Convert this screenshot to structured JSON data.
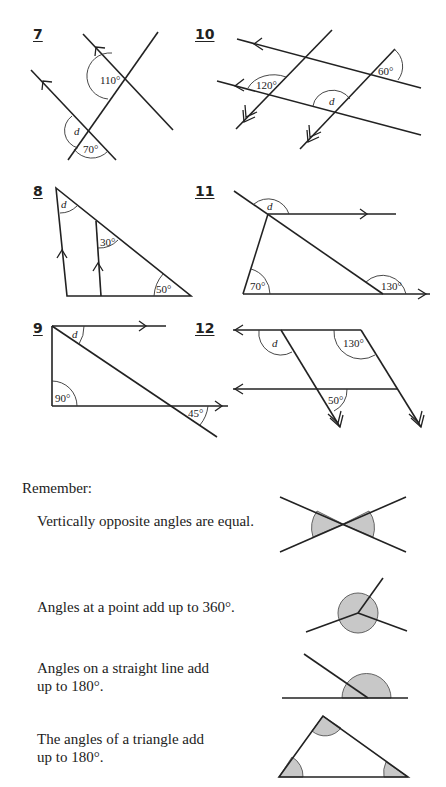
{
  "questions": [
    {
      "number": "7",
      "labels": {
        "a": "110°",
        "b": "70°",
        "unknown": "d"
      }
    },
    {
      "number": "10",
      "labels": {
        "a": "120°",
        "b": "60°",
        "unknown": "d"
      }
    },
    {
      "number": "8",
      "labels": {
        "a": "30°",
        "b": "50°",
        "unknown": "d"
      }
    },
    {
      "number": "11",
      "labels": {
        "a": "70°",
        "b": "130°",
        "unknown": "d"
      }
    },
    {
      "number": "9",
      "labels": {
        "a": "90°",
        "b": "45°",
        "unknown": "d"
      }
    },
    {
      "number": "12",
      "labels": {
        "a": "130°",
        "b": "50°",
        "unknown": "d"
      }
    }
  ],
  "remember": {
    "heading": "Remember:",
    "rules": [
      {
        "line1": "Vertically opposite angles are equal.",
        "line2": ""
      },
      {
        "line1": "Angles at a point add up to 360°.",
        "line2": ""
      },
      {
        "line1": "Angles on a straight line add",
        "line2": "up to 180°."
      },
      {
        "line1": "The angles of a triangle add",
        "line2": "up to 180°."
      }
    ]
  },
  "colors": {
    "ink": "#222222",
    "shade": "#c8c8c8",
    "background": "#ffffff"
  }
}
